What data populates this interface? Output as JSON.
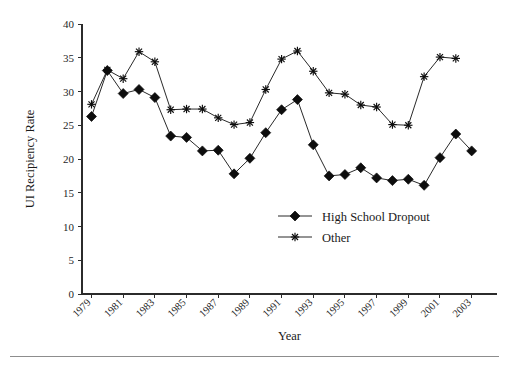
{
  "chart_data": {
    "type": "line",
    "title": "",
    "xlabel": "Year",
    "ylabel": "UI Recipiency Rate",
    "xlim": [
      1978.4,
      2004.6
    ],
    "ylim": [
      0,
      40
    ],
    "grid": false,
    "legend_position": "center-bottom-inside",
    "y_ticks": [
      0,
      5,
      10,
      15,
      20,
      25,
      30,
      35,
      40
    ],
    "y_tick_labels": [
      "0",
      "5",
      "10",
      "15",
      "20",
      "25",
      "30",
      "35",
      "40"
    ],
    "x_ticks": [
      1979,
      1981,
      1983,
      1985,
      1987,
      1989,
      1991,
      1993,
      1995,
      1997,
      1999,
      2001,
      2003
    ],
    "x_tick_labels": [
      "1979",
      "1981",
      "1983",
      "1985",
      "1987",
      "1989",
      "1991",
      "1993",
      "1995",
      "1997",
      "1999",
      "2001",
      "2003"
    ],
    "x": [
      1979,
      1980,
      1981,
      1982,
      1983,
      1984,
      1985,
      1986,
      1987,
      1988,
      1989,
      1990,
      1991,
      1992,
      1993,
      1994,
      1995,
      1996,
      1997,
      1998,
      1999,
      2000,
      2001,
      2002,
      2003,
      2004
    ],
    "series": [
      {
        "name": "High School Dropout",
        "marker": "diamond",
        "color": "#0d0d0d",
        "x": [
          1979,
          1980,
          1981,
          1982,
          1983,
          1984,
          1985,
          1986,
          1987,
          1988,
          1989,
          1990,
          1991,
          1992,
          1993,
          1994,
          1995,
          1996,
          1997,
          1998,
          1999,
          2000,
          2001,
          2002,
          2003
        ],
        "values": [
          26.3,
          33.1,
          29.7,
          30.3,
          29.1,
          23.4,
          23.2,
          21.2,
          21.3,
          17.8,
          20.1,
          23.9,
          27.3,
          28.8,
          22.1,
          17.5,
          17.7,
          18.7,
          17.2,
          16.8,
          17.0,
          16.1,
          20.2,
          23.7,
          21.2
        ]
      },
      {
        "name": "Other",
        "marker": "star",
        "color": "#0d0d0d",
        "x": [
          1979,
          1980,
          1981,
          1982,
          1983,
          1984,
          1985,
          1986,
          1987,
          1988,
          1989,
          1990,
          1991,
          1992,
          1993,
          1994,
          1995,
          1996,
          1997,
          1998,
          1999,
          2000,
          2001,
          2002
        ],
        "values": [
          28.1,
          33.2,
          31.9,
          35.9,
          34.4,
          27.3,
          27.4,
          27.4,
          26.1,
          25.1,
          25.4,
          30.3,
          34.8,
          36.0,
          33.0,
          29.8,
          29.6,
          28.0,
          27.7,
          25.1,
          25.0,
          32.2,
          35.1,
          34.9
        ]
      }
    ],
    "legend": [
      {
        "label": "High School Dropout",
        "marker": "diamond"
      },
      {
        "label": "Other",
        "marker": "star"
      }
    ]
  }
}
